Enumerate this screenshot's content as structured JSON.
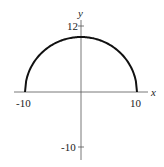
{
  "chart_data": {
    "type": "line",
    "title": "",
    "xlabel": "x",
    "ylabel": "y",
    "x_ticks": [
      -10,
      10
    ],
    "y_ticks": [
      12,
      -10
    ],
    "xlim": [
      -12,
      12
    ],
    "ylim": [
      -12,
      13
    ],
    "grid": false,
    "series": [
      {
        "name": "semicircle y = sqrt(100 - x^2)",
        "x": [
          -10,
          -8,
          -6,
          -4,
          -2,
          0,
          2,
          4,
          6,
          8,
          10
        ],
        "y": [
          0,
          6,
          8,
          9.17,
          9.8,
          10,
          9.8,
          9.17,
          8,
          6,
          0
        ]
      }
    ]
  },
  "labels": {
    "x_axis": "x",
    "y_axis": "y",
    "tick_x_neg": "-10",
    "tick_x_pos": "10",
    "tick_y_pos": "12",
    "tick_y_neg": "-10"
  }
}
